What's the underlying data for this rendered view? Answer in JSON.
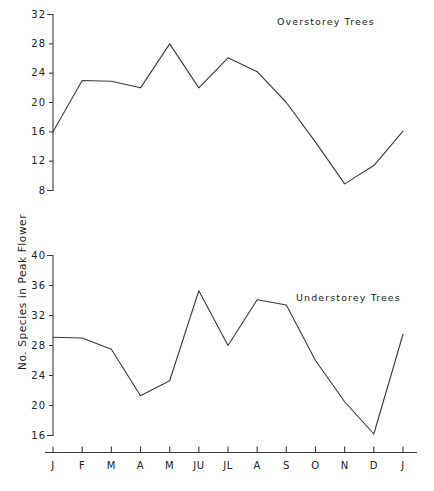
{
  "figure": {
    "y_axis_label": "No. Species in Peak Flower",
    "background_color": "#ffffff",
    "line_color": "#3a3a3a"
  },
  "x_categories": [
    "J",
    "F",
    "M",
    "A",
    "M",
    "JU",
    "JL",
    "A",
    "S",
    "O",
    "N",
    "D",
    "J"
  ],
  "chart_data": [
    {
      "type": "line",
      "title": "Overstorey Trees",
      "xlabel": "",
      "ylabel": "No. Species in Peak Flower",
      "categories": [
        "J",
        "F",
        "M",
        "A",
        "M",
        "JU",
        "JL",
        "A",
        "S",
        "O",
        "N",
        "D",
        "J"
      ],
      "values": [
        16.0,
        23.0,
        22.9,
        22.0,
        28.0,
        22.0,
        26.1,
        24.2,
        20.0,
        14.6,
        8.9,
        11.4,
        16.1
      ],
      "ylim": [
        8,
        32
      ],
      "yticks": [
        8,
        12,
        16,
        20,
        24,
        28,
        32
      ],
      "grid": false,
      "legend": "none",
      "annotations": [
        "Minimum near November (~8.2)",
        "Peak at May (28)"
      ]
    },
    {
      "type": "line",
      "title": "Understorey Trees",
      "xlabel": "",
      "ylabel": "No. Species in Peak Flower",
      "categories": [
        "J",
        "F",
        "M",
        "A",
        "M",
        "JU",
        "JL",
        "A",
        "S",
        "O",
        "N",
        "D",
        "J"
      ],
      "values": [
        29.1,
        29.0,
        27.5,
        21.3,
        23.3,
        35.3,
        28.0,
        34.1,
        33.4,
        26.0,
        20.5,
        16.2,
        29.5
      ],
      "ylim": [
        16,
        40
      ],
      "yticks": [
        16,
        20,
        24,
        28,
        32,
        36,
        40
      ],
      "grid": false,
      "legend": "none",
      "annotations": [
        "Peak at JU (~35.3)",
        "Minimum at D (~16.2)"
      ]
    }
  ]
}
